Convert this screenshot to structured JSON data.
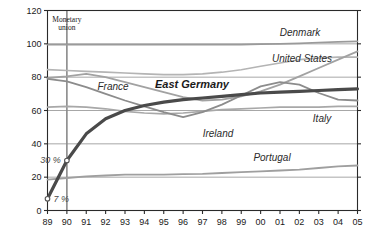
{
  "chart_data": {
    "type": "line",
    "title": "",
    "xlabel": "",
    "ylabel": "",
    "ylim": [
      0,
      120
    ],
    "yticks": [
      0,
      20,
      40,
      60,
      80,
      100,
      120
    ],
    "ytick_labels": [
      "0",
      "20",
      "40",
      "60",
      "80",
      "100",
      "120"
    ],
    "grid": true,
    "legend": "inline-labels",
    "x": [
      1989,
      1990,
      1991,
      1992,
      1993,
      1994,
      1995,
      1996,
      1997,
      1998,
      1999,
      2000,
      2001,
      2002,
      2003,
      2004,
      2005
    ],
    "xtick_labels": [
      "89",
      "90",
      "91",
      "92",
      "93",
      "94",
      "95",
      "96",
      "97",
      "98",
      "99",
      "00",
      "01",
      "02",
      "03",
      "04",
      "05"
    ],
    "series": [
      {
        "name": "Denmark",
        "color": "#9a9a9a",
        "width": 1.6,
        "values": [
          99.5,
          99.5,
          99.5,
          99.5,
          99.5,
          99.5,
          99.5,
          99.5,
          99.5,
          99.5,
          99.5,
          99.8,
          100.0,
          100.3,
          100.8,
          101.2,
          101.5
        ]
      },
      {
        "name": "United States",
        "color": "#b4b4b4",
        "width": 1.6,
        "values": [
          84.5,
          84.0,
          83.5,
          83.0,
          82.5,
          82.0,
          81.5,
          81.5,
          82.0,
          83.0,
          84.5,
          86.5,
          88.5,
          90.5,
          91.5,
          92.0,
          92.0
        ]
      },
      {
        "name": "France",
        "color": "#a2a2a2",
        "width": 1.8,
        "values": [
          79.5,
          80.5,
          82.0,
          80.0,
          77.0,
          74.0,
          71.0,
          68.0,
          66.0,
          66.5,
          68.5,
          71.5,
          75.5,
          80.5,
          85.5,
          90.5,
          95.5
        ]
      },
      {
        "name": "Italy",
        "color": "#a8a8a8",
        "width": 1.6,
        "values": [
          62.0,
          62.5,
          62.0,
          61.0,
          59.5,
          58.5,
          58.0,
          58.5,
          59.5,
          60.5,
          61.0,
          61.5,
          62.0,
          62.0,
          62.0,
          62.5,
          62.5
        ]
      },
      {
        "name": "Ireland",
        "color": "#8c8c8c",
        "width": 1.8,
        "values": [
          79.0,
          77.5,
          74.0,
          70.0,
          66.0,
          62.5,
          59.0,
          56.0,
          59.0,
          63.5,
          69.0,
          74.5,
          77.0,
          75.5,
          70.5,
          66.5,
          66.0
        ]
      },
      {
        "name": "Portugal",
        "color": "#9f9f9f",
        "width": 1.8,
        "values": [
          18.5,
          19.5,
          20.5,
          21.0,
          21.5,
          21.5,
          21.5,
          21.8,
          22.0,
          22.5,
          23.0,
          23.5,
          24.0,
          24.5,
          25.5,
          26.5,
          27.0
        ]
      },
      {
        "name": "East Germany",
        "color": "#4a4a4a",
        "width": 3.2,
        "bold": true,
        "values": [
          7.0,
          30.0,
          46.0,
          55.0,
          60.0,
          63.0,
          65.0,
          66.5,
          67.5,
          68.5,
          69.5,
          70.5,
          71.0,
          71.5,
          72.0,
          72.5,
          73.0
        ]
      }
    ],
    "series_labels": [
      {
        "text": "Denmark",
        "x": 300,
        "y": 36,
        "style": "italic"
      },
      {
        "text": "United States",
        "x": 302,
        "y": 62,
        "style": "italic"
      },
      {
        "text": "France",
        "x": 113,
        "y": 90,
        "style": "italic"
      },
      {
        "text": "East Germany",
        "x": 192,
        "y": 88,
        "style": "italic-bold"
      },
      {
        "text": "Italy",
        "x": 322,
        "y": 122,
        "style": "italic"
      },
      {
        "text": "Ireland",
        "x": 218,
        "y": 137,
        "style": "italic"
      },
      {
        "text": "Portugal",
        "x": 272,
        "y": 161,
        "style": "italic"
      }
    ],
    "annotations": [
      {
        "text": "Monetary union",
        "line1": "Monetary",
        "line2": "union",
        "x": 1990,
        "type": "vline-label"
      },
      {
        "text": "30 %",
        "x": 1990,
        "y": 30,
        "marker": true
      },
      {
        "text": "7 %",
        "x": 1989,
        "y": 7,
        "marker": true
      }
    ],
    "vline": {
      "year": 1990,
      "color": "#8a8a8a"
    }
  }
}
